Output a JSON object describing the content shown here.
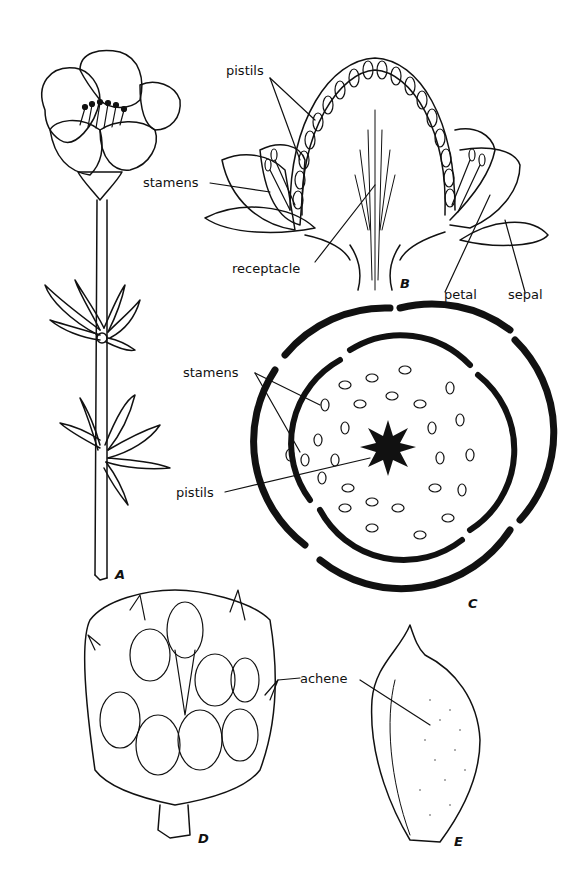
{
  "diagram": {
    "figures": {
      "A": "A",
      "B": "B",
      "C": "C",
      "D": "D",
      "E": "E"
    },
    "labels": {
      "pistils_b": "pistils",
      "stamens_b": "stamens",
      "receptacle": "receptacle",
      "petal": "petal",
      "sepal": "sepal",
      "stamens_c": "stamens",
      "pistils_c": "pistils",
      "achene": "achene"
    },
    "colors": {
      "ink": "#111111",
      "background": "#ffffff"
    }
  }
}
